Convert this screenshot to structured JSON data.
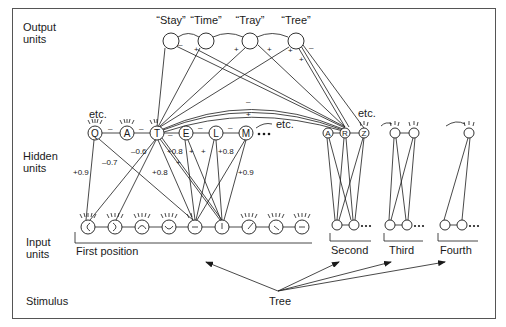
{
  "layers": {
    "output": "Output\nunits",
    "hidden": "Hidden\nunits",
    "input": "Input\nunits",
    "stimulus": "Stimulus"
  },
  "layer_labels": [
    {
      "key": "output",
      "lines": [
        "Output",
        "units"
      ],
      "x": 22,
      "y": 31
    },
    {
      "key": "hidden",
      "lines": [
        "Hidden",
        "units"
      ],
      "x": 22,
      "y": 160
    },
    {
      "key": "input",
      "lines": [
        "Input",
        "units"
      ],
      "x": 22,
      "y": 246
    },
    {
      "key": "stimulus",
      "lines": [
        "Stimulus"
      ],
      "x": 25,
      "y": 296
    }
  ],
  "output_units": [
    {
      "id": "stay",
      "label": "“Stay”",
      "x": 171,
      "y": 40
    },
    {
      "id": "time",
      "label": "“Time”",
      "x": 206,
      "y": 40
    },
    {
      "id": "tray",
      "label": "“Tray”",
      "x": 250,
      "y": 40
    },
    {
      "id": "tree",
      "label": "“Tree”",
      "x": 295,
      "y": 40
    }
  ],
  "output_signs": [
    {
      "text": "–",
      "x": 180,
      "y": 45
    },
    {
      "text": "+",
      "x": 196,
      "y": 50
    },
    {
      "text": "+",
      "x": 236,
      "y": 50
    },
    {
      "text": "+",
      "x": 266,
      "y": 50
    },
    {
      "text": "+",
      "x": 290,
      "y": 51
    },
    {
      "text": "+",
      "x": 301,
      "y": 60
    },
    {
      "text": "–",
      "x": 311,
      "y": 48
    }
  ],
  "hidden_units": [
    {
      "id": "Q",
      "label": "Q",
      "x": 95,
      "y": 133
    },
    {
      "id": "A",
      "label": "A",
      "x": 127,
      "y": 133
    },
    {
      "id": "T",
      "label": "T",
      "x": 157,
      "y": 133
    },
    {
      "id": "E",
      "label": "E",
      "x": 186,
      "y": 133
    },
    {
      "id": "L",
      "label": "L",
      "x": 216,
      "y": 133
    },
    {
      "id": "M",
      "label": "M",
      "x": 246,
      "y": 133
    }
  ],
  "hidden_inhibition_signs": [
    "–",
    "–",
    "–",
    "–",
    "–"
  ],
  "hidden_etc_left": "etc.",
  "hidden_etc_right": "etc.",
  "second_hidden": [
    {
      "id": "A2",
      "label": "A",
      "x": 328,
      "y": 133
    },
    {
      "id": "R",
      "label": "R",
      "x": 345,
      "y": 133
    },
    {
      "id": "Z",
      "label": "Z",
      "x": 364,
      "y": 133
    }
  ],
  "second_etc": "etc.",
  "third_hidden": [
    {
      "x": 395,
      "y": 133
    },
    {
      "x": 414,
      "y": 133
    }
  ],
  "fourth_hidden": [
    {
      "x": 469,
      "y": 133
    }
  ],
  "weights": [
    {
      "text": "–0.6",
      "x": 134,
      "y": 152
    },
    {
      "text": "–0.7",
      "x": 103,
      "y": 163
    },
    {
      "text": "+0.9",
      "x": 74,
      "y": 173
    },
    {
      "text": "+0.8",
      "x": 169,
      "y": 152
    },
    {
      "text": "+",
      "x": 190,
      "y": 152
    },
    {
      "text": "+",
      "x": 203,
      "y": 152
    },
    {
      "text": "+0.8",
      "x": 219,
      "y": 152
    },
    {
      "text": "+",
      "x": 176,
      "y": 163
    },
    {
      "text": "+0.8",
      "x": 155,
      "y": 173
    },
    {
      "text": "+0.9",
      "x": 240,
      "y": 173
    }
  ],
  "arc_signs": [
    {
      "text": "–",
      "x": 248,
      "y": 101
    },
    {
      "text": "+",
      "x": 248,
      "y": 115
    }
  ],
  "input_units_first": [
    {
      "x": 88,
      "glyph": "left-arc"
    },
    {
      "x": 115,
      "glyph": "right-arc"
    },
    {
      "x": 142,
      "glyph": "top-arc"
    },
    {
      "x": 169,
      "glyph": "bottom-arc"
    },
    {
      "x": 195,
      "glyph": "horizontal"
    },
    {
      "x": 222,
      "glyph": "vertical"
    },
    {
      "x": 249,
      "glyph": "diag-up"
    },
    {
      "x": 276,
      "glyph": "diag-down"
    },
    {
      "x": 302,
      "glyph": "horizontal-short"
    }
  ],
  "input_y": 227,
  "position_labels": {
    "first": "First position",
    "second": "Second",
    "third": "Third",
    "fourth": "Fourth"
  },
  "stimulus_word": "Tree",
  "colors": {
    "ink": "#1a1a1a",
    "frame": "#555555",
    "background": "#ffffff"
  }
}
